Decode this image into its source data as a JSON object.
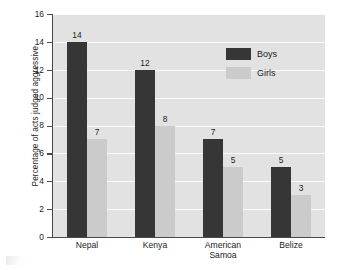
{
  "chart_data": {
    "type": "bar",
    "title": "",
    "subtitle": "",
    "xlabel": "",
    "ylabel": "Percentage of acts judged aggressive",
    "categories": [
      "Nepal",
      "Kenya",
      "American Samoa",
      "Belize"
    ],
    "category_lines": [
      [
        "Nepal"
      ],
      [
        "Kenya"
      ],
      [
        "American",
        "Samoa"
      ],
      [
        "Belize"
      ]
    ],
    "series": [
      {
        "name": "Boys",
        "color": "#363636",
        "values": [
          14,
          12,
          7,
          5
        ]
      },
      {
        "name": "Girls",
        "color": "#cbcbcb",
        "values": [
          7,
          8,
          5,
          3
        ]
      }
    ],
    "ylim": [
      0,
      16
    ],
    "ytick_values": [
      0,
      2,
      4,
      6,
      8,
      10,
      12,
      14,
      16
    ],
    "ytick_labels": [
      "0",
      "2",
      "4",
      "6",
      "8",
      "10",
      "12",
      "14",
      "16"
    ],
    "grid": {
      "horizontal": true,
      "vertical": false,
      "color": "#fbfbfb"
    },
    "plot_background": "#e2e2e2",
    "figure_background": "#ffffff",
    "legend": {
      "position": "upper-right-inside",
      "entries": [
        {
          "label": "Boys",
          "color": "#363636"
        },
        {
          "label": "Girls",
          "color": "#cbcbcb"
        }
      ]
    },
    "data_labels": {
      "shown": true,
      "Boys": [
        "14",
        "12",
        "7",
        "5"
      ],
      "Girls": [
        "7",
        "8",
        "5",
        "3"
      ]
    }
  }
}
